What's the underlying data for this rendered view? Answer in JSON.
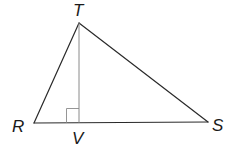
{
  "diagram": {
    "type": "triangle-with-altitude",
    "vertices": {
      "T": {
        "label": "T",
        "x": 79,
        "y": 23
      },
      "R": {
        "label": "R",
        "x": 34,
        "y": 123
      },
      "S": {
        "label": "S",
        "x": 208,
        "y": 122
      },
      "V": {
        "label": "V",
        "x": 79,
        "y": 123
      }
    },
    "labels": {
      "T": "T",
      "R": "R",
      "S": "S",
      "V": "V"
    },
    "segments": [
      {
        "from": "R",
        "to": "T",
        "style": "edge"
      },
      {
        "from": "T",
        "to": "S",
        "style": "edge"
      },
      {
        "from": "R",
        "to": "S",
        "style": "edge"
      },
      {
        "from": "T",
        "to": "V",
        "style": "altitude"
      }
    ],
    "right_angle_at": "V",
    "colors": {
      "edge": "#2a2a2a",
      "altitude": "#8a8a8a",
      "background": "#ffffff"
    }
  }
}
